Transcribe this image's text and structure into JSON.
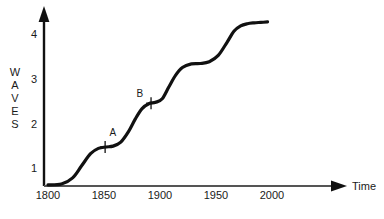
{
  "chart_data": {
    "type": "line",
    "title": "",
    "subtitle": "",
    "xlabel": "Time",
    "ylabel": "WAVES",
    "ylabel_letters": [
      "W",
      "A",
      "V",
      "E",
      "S"
    ],
    "xlim": [
      1800,
      2010
    ],
    "ylim": [
      0.55,
      4.35
    ],
    "xticks": [
      1800,
      1850,
      1900,
      1950,
      2000
    ],
    "xtick_labels": [
      "1800",
      "1850",
      "1900",
      "1950",
      "2000"
    ],
    "yticks": [
      1,
      2,
      3,
      4
    ],
    "ytick_labels": [
      "1",
      "2",
      "3",
      "4"
    ],
    "grid": false,
    "legend": null,
    "axis_style": {
      "x_axis_arrow": true,
      "y_axis_arrow": true,
      "line_color": "#111111",
      "curve_color": "#111111",
      "curve_width": 3.2
    },
    "series": [
      {
        "name": "Waves",
        "description": "Rising staircase of successive innovation waves",
        "x": [
          1800,
          1812,
          1822,
          1830,
          1838,
          1845,
          1852,
          1858,
          1865,
          1872,
          1878,
          1884,
          1890,
          1896,
          1902,
          1908,
          1914,
          1920,
          1928,
          1936,
          1944,
          1952,
          1960,
          1966,
          1972,
          1978,
          1984,
          1990,
          1996
        ],
        "y": [
          0.62,
          0.64,
          0.78,
          1.05,
          1.32,
          1.44,
          1.47,
          1.49,
          1.58,
          1.82,
          2.1,
          2.33,
          2.44,
          2.47,
          2.55,
          2.82,
          3.08,
          3.25,
          3.33,
          3.34,
          3.38,
          3.52,
          3.82,
          4.06,
          4.18,
          4.23,
          4.25,
          4.26,
          4.27
        ]
      }
    ],
    "annotations": [
      {
        "label": "A",
        "marker": "plus-cross",
        "x": 1851,
        "y": 1.47,
        "label_x": 1858,
        "label_y": 1.72
      },
      {
        "label": "B",
        "marker": "plus-cross",
        "x": 1892,
        "y": 2.45,
        "label_x": 1882,
        "label_y": 2.6
      }
    ]
  }
}
